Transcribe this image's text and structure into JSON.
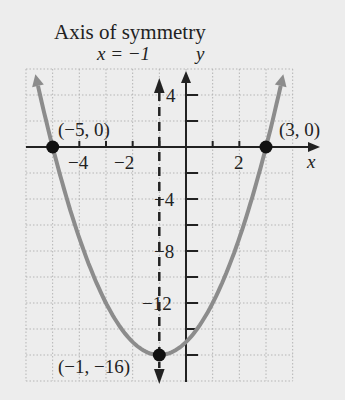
{
  "chart_data": {
    "type": "line",
    "title": "Axis of symmetry",
    "annotation_axis": "x = −1",
    "function": "y = (x+1)^2 - 16",
    "xlabel": "x",
    "ylabel": "y",
    "xlim": [
      -6,
      4
    ],
    "ylim": [
      -18,
      6
    ],
    "x_ticks": [
      -4,
      -2,
      2
    ],
    "y_ticks": [
      4,
      -4,
      -8,
      -12
    ],
    "grid": true,
    "points": [
      {
        "label": "(−5, 0)",
        "x": -5,
        "y": 0
      },
      {
        "label": "(3, 0)",
        "x": 3,
        "y": 0
      },
      {
        "label": "(−1, −16)",
        "x": -1,
        "y": -16
      }
    ],
    "axis_of_symmetry": -1,
    "colors": {
      "curve": "#8c8c8c",
      "axis": "#222222",
      "grid": "#b5b5b5",
      "background": "#ededed"
    }
  },
  "labels": {
    "title": "Axis of symmetry",
    "axis_eq": "x = −1",
    "y_axis": "y",
    "x_axis": "x",
    "pt_left": "(−5, 0)",
    "pt_right": "(3, 0)",
    "pt_vertex": "(−1, −16)",
    "tick_x_m4": "−4",
    "tick_x_m2": "−2",
    "tick_x_2": "2",
    "tick_y_4": "4",
    "tick_y_m4": "−4",
    "tick_y_m8": "−8",
    "tick_y_m12": "−12"
  }
}
